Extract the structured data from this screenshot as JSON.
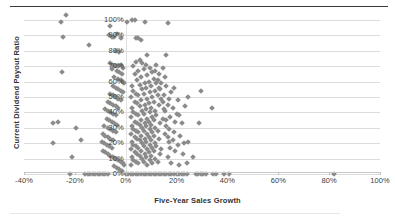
{
  "chart_data": {
    "type": "scatter",
    "title": "",
    "xlabel": "Five-Year Sales Growth",
    "ylabel": "Current Dividend Payout Ratio",
    "xlim": [
      -40,
      100
    ],
    "ylim": [
      0,
      100
    ],
    "xticks": [
      "-40%",
      "-20%",
      "0%",
      "20%",
      "40%",
      "60%",
      "80%",
      "100%"
    ],
    "xtick_values": [
      -40,
      -20,
      0,
      20,
      40,
      60,
      80,
      100
    ],
    "yticks": [
      "0%",
      "10%",
      "20%",
      "30%",
      "40%",
      "50%",
      "60%",
      "70%",
      "80%",
      "90%",
      "100%"
    ],
    "ytick_values": [
      0,
      10,
      20,
      30,
      40,
      50,
      60,
      70,
      80,
      90,
      100
    ],
    "grid": "horizontal",
    "legend": "none",
    "marker": "diamond",
    "marker_color": "#8b8b8b",
    "points": [
      [
        -23.5,
        103
      ],
      [
        -25.5,
        99
      ],
      [
        -24.5,
        89
      ],
      [
        -14.5,
        84
      ],
      [
        -25.0,
        66
      ],
      [
        -28.5,
        33
      ],
      [
        -26.5,
        34
      ],
      [
        -28.5,
        20
      ],
      [
        -19.5,
        30
      ],
      [
        -17.5,
        22
      ],
      [
        -21.0,
        11
      ],
      [
        -22.0,
        0
      ],
      [
        -16.0,
        0
      ],
      [
        -15.0,
        0
      ],
      [
        -14.0,
        0
      ],
      [
        -13.0,
        0
      ],
      [
        -12.0,
        0
      ],
      [
        -11.0,
        0
      ],
      [
        -10.0,
        0
      ],
      [
        -9.0,
        0
      ],
      [
        -8.0,
        0
      ],
      [
        -7.0,
        0
      ],
      [
        -6.0,
        96
      ],
      [
        -6.5,
        90
      ],
      [
        -5.5,
        89
      ],
      [
        -4.5,
        89
      ],
      [
        -3.5,
        91
      ],
      [
        -2.0,
        88
      ],
      [
        -4.0,
        80
      ],
      [
        -2.5,
        79
      ],
      [
        -6.0,
        72
      ],
      [
        -5.0,
        71
      ],
      [
        -4.0,
        70
      ],
      [
        -3.0,
        70
      ],
      [
        -2.0,
        71
      ],
      [
        -1.0,
        69
      ],
      [
        -5.5,
        68
      ],
      [
        -3.5,
        67
      ],
      [
        -2.5,
        66
      ],
      [
        -1.5,
        65
      ],
      [
        -4.5,
        63
      ],
      [
        -3.0,
        62
      ],
      [
        -2.0,
        61
      ],
      [
        -1.0,
        60
      ],
      [
        -0.5,
        59
      ],
      [
        -5.0,
        57
      ],
      [
        -4.0,
        56
      ],
      [
        -3.0,
        55
      ],
      [
        -2.0,
        54
      ],
      [
        -1.0,
        53
      ],
      [
        -6.0,
        52
      ],
      [
        -5.0,
        51
      ],
      [
        -4.0,
        50
      ],
      [
        -3.0,
        49
      ],
      [
        -2.0,
        48
      ],
      [
        -7.0,
        47
      ],
      [
        -6.0,
        46
      ],
      [
        -5.0,
        45
      ],
      [
        -4.0,
        44
      ],
      [
        -3.0,
        43
      ],
      [
        -8.0,
        42
      ],
      [
        -7.0,
        41
      ],
      [
        -6.0,
        40
      ],
      [
        -5.0,
        39
      ],
      [
        -4.0,
        38
      ],
      [
        -7.5,
        36
      ],
      [
        -6.5,
        35
      ],
      [
        -5.5,
        34
      ],
      [
        -4.5,
        33
      ],
      [
        -3.5,
        32
      ],
      [
        -8.5,
        31
      ],
      [
        -7.0,
        30
      ],
      [
        -6.0,
        29
      ],
      [
        -5.0,
        28
      ],
      [
        -4.0,
        27
      ],
      [
        -9.0,
        26
      ],
      [
        -8.0,
        25
      ],
      [
        -7.0,
        24
      ],
      [
        -6.0,
        23
      ],
      [
        -5.0,
        22
      ],
      [
        -9.5,
        21
      ],
      [
        -8.5,
        20
      ],
      [
        -7.5,
        19
      ],
      [
        -6.5,
        18
      ],
      [
        -5.5,
        17
      ],
      [
        -9.0,
        15
      ],
      [
        -8.0,
        14
      ],
      [
        -7.0,
        13
      ],
      [
        -6.0,
        12
      ],
      [
        -5.0,
        11
      ],
      [
        -4.0,
        10
      ],
      [
        -3.0,
        9
      ],
      [
        -2.0,
        8
      ],
      [
        -1.0,
        7
      ],
      [
        -0.5,
        6
      ],
      [
        -4.5,
        5
      ],
      [
        -3.5,
        4
      ],
      [
        -2.5,
        3
      ],
      [
        -1.5,
        2
      ],
      [
        0.5,
        99
      ],
      [
        2.5,
        100
      ],
      [
        3.5,
        100
      ],
      [
        7.5,
        99
      ],
      [
        4.0,
        88
      ],
      [
        5.0,
        88
      ],
      [
        6.0,
        87
      ],
      [
        8.5,
        77
      ],
      [
        5.5,
        74
      ],
      [
        4.0,
        73
      ],
      [
        6.5,
        72
      ],
      [
        8.0,
        71
      ],
      [
        3.0,
        70
      ],
      [
        9.5,
        69
      ],
      [
        7.0,
        68
      ],
      [
        5.0,
        67
      ],
      [
        10.5,
        66
      ],
      [
        3.5,
        65
      ],
      [
        8.5,
        64
      ],
      [
        6.0,
        63
      ],
      [
        11.0,
        62
      ],
      [
        4.5,
        61
      ],
      [
        9.0,
        60
      ],
      [
        7.5,
        59
      ],
      [
        12.0,
        59
      ],
      [
        5.5,
        58
      ],
      [
        10.0,
        57
      ],
      [
        2.5,
        57
      ],
      [
        8.0,
        56
      ],
      [
        13.0,
        56
      ],
      [
        6.5,
        55
      ],
      [
        11.5,
        54
      ],
      [
        3.0,
        54
      ],
      [
        9.5,
        53
      ],
      [
        4.0,
        52
      ],
      [
        7.0,
        52
      ],
      [
        12.5,
        51
      ],
      [
        5.0,
        51
      ],
      [
        10.5,
        50
      ],
      [
        2.0,
        50
      ],
      [
        8.5,
        49
      ],
      [
        14.0,
        49
      ],
      [
        6.0,
        48
      ],
      [
        11.0,
        47
      ],
      [
        3.5,
        47
      ],
      [
        9.0,
        46
      ],
      [
        4.5,
        46
      ],
      [
        7.5,
        45
      ],
      [
        13.0,
        45
      ],
      [
        5.5,
        44
      ],
      [
        10.0,
        43
      ],
      [
        2.5,
        43
      ],
      [
        8.0,
        42
      ],
      [
        15.0,
        42
      ],
      [
        6.5,
        41
      ],
      [
        11.5,
        41
      ],
      [
        3.0,
        40
      ],
      [
        9.5,
        40
      ],
      [
        4.0,
        39
      ],
      [
        7.0,
        39
      ],
      [
        12.0,
        38
      ],
      [
        5.0,
        38
      ],
      [
        10.5,
        37
      ],
      [
        2.0,
        37
      ],
      [
        8.5,
        36
      ],
      [
        14.5,
        36
      ],
      [
        6.0,
        35
      ],
      [
        11.0,
        35
      ],
      [
        3.5,
        34
      ],
      [
        9.0,
        34
      ],
      [
        4.5,
        33
      ],
      [
        7.5,
        33
      ],
      [
        13.5,
        33
      ],
      [
        5.5,
        32
      ],
      [
        10.0,
        32
      ],
      [
        2.5,
        31
      ],
      [
        8.0,
        31
      ],
      [
        16.0,
        31
      ],
      [
        6.5,
        30
      ],
      [
        11.5,
        30
      ],
      [
        3.0,
        29
      ],
      [
        9.5,
        29
      ],
      [
        4.0,
        28
      ],
      [
        7.0,
        28
      ],
      [
        12.5,
        28
      ],
      [
        5.0,
        27
      ],
      [
        10.5,
        27
      ],
      [
        2.0,
        26
      ],
      [
        8.5,
        26
      ],
      [
        15.5,
        26
      ],
      [
        6.0,
        25
      ],
      [
        11.0,
        25
      ],
      [
        3.5,
        24
      ],
      [
        9.0,
        24
      ],
      [
        4.5,
        23
      ],
      [
        7.5,
        23
      ],
      [
        13.0,
        23
      ],
      [
        5.5,
        22
      ],
      [
        10.0,
        22
      ],
      [
        2.5,
        21
      ],
      [
        8.0,
        21
      ],
      [
        17.0,
        21
      ],
      [
        6.5,
        20
      ],
      [
        11.5,
        20
      ],
      [
        3.0,
        19
      ],
      [
        9.5,
        19
      ],
      [
        4.0,
        18
      ],
      [
        7.0,
        18
      ],
      [
        12.0,
        18
      ],
      [
        5.0,
        17
      ],
      [
        10.5,
        17
      ],
      [
        2.0,
        16
      ],
      [
        8.5,
        16
      ],
      [
        14.0,
        16
      ],
      [
        6.0,
        15
      ],
      [
        11.0,
        15
      ],
      [
        3.5,
        14
      ],
      [
        9.0,
        14
      ],
      [
        4.5,
        13
      ],
      [
        7.5,
        13
      ],
      [
        13.5,
        13
      ],
      [
        5.5,
        12
      ],
      [
        10.0,
        12
      ],
      [
        2.5,
        11
      ],
      [
        8.0,
        11
      ],
      [
        16.5,
        11
      ],
      [
        6.5,
        10
      ],
      [
        11.5,
        10
      ],
      [
        3.0,
        9
      ],
      [
        9.5,
        9
      ],
      [
        4.0,
        8
      ],
      [
        7.0,
        8
      ],
      [
        12.5,
        8
      ],
      [
        5.0,
        7
      ],
      [
        10.5,
        7
      ],
      [
        2.0,
        6
      ],
      [
        8.5,
        6
      ],
      [
        18.0,
        7
      ],
      [
        21.0,
        6
      ],
      [
        24.0,
        7
      ],
      [
        26.5,
        11
      ],
      [
        22.5,
        13
      ],
      [
        19.5,
        15
      ],
      [
        17.5,
        17
      ],
      [
        20.5,
        19
      ],
      [
        23.0,
        20
      ],
      [
        18.5,
        22
      ],
      [
        16.5,
        24
      ],
      [
        21.5,
        25
      ],
      [
        19.0,
        27
      ],
      [
        17.0,
        29
      ],
      [
        24.5,
        21
      ],
      [
        16.0,
        35
      ],
      [
        19.5,
        34
      ],
      [
        22.0,
        33
      ],
      [
        17.5,
        37
      ],
      [
        20.0,
        39
      ],
      [
        15.5,
        41
      ],
      [
        18.5,
        43
      ],
      [
        21.0,
        38
      ],
      [
        16.5,
        45
      ],
      [
        23.5,
        44
      ],
      [
        14.5,
        47
      ],
      [
        17.0,
        49
      ],
      [
        20.5,
        48
      ],
      [
        15.0,
        51
      ],
      [
        18.0,
        53
      ],
      [
        13.5,
        55
      ],
      [
        16.0,
        57
      ],
      [
        19.0,
        56
      ],
      [
        14.0,
        59
      ],
      [
        12.5,
        61
      ],
      [
        15.5,
        63
      ],
      [
        13.0,
        65
      ],
      [
        11.5,
        67
      ],
      [
        14.5,
        69
      ],
      [
        12.0,
        71
      ],
      [
        16.0,
        77
      ],
      [
        16.5,
        98
      ],
      [
        29.5,
        54
      ],
      [
        34.0,
        43
      ],
      [
        29.0,
        33
      ],
      [
        24.5,
        50
      ],
      [
        0.0,
        0
      ],
      [
        1.0,
        0
      ],
      [
        2.0,
        0
      ],
      [
        3.0,
        0
      ],
      [
        4.0,
        0
      ],
      [
        5.0,
        0
      ],
      [
        6.0,
        0
      ],
      [
        7.0,
        0
      ],
      [
        8.0,
        0
      ],
      [
        9.0,
        0
      ],
      [
        10.0,
        0
      ],
      [
        11.0,
        0
      ],
      [
        12.0,
        0
      ],
      [
        13.0,
        0
      ],
      [
        14.0,
        0
      ],
      [
        15.0,
        0
      ],
      [
        16.0,
        0
      ],
      [
        17.0,
        0
      ],
      [
        18.0,
        0
      ],
      [
        19.0,
        0
      ],
      [
        20.0,
        0
      ],
      [
        21.0,
        0
      ],
      [
        22.0,
        0
      ],
      [
        23.0,
        0
      ],
      [
        24.0,
        0
      ],
      [
        27.5,
        0
      ],
      [
        28.5,
        0
      ],
      [
        29.5,
        0
      ],
      [
        30.5,
        0
      ],
      [
        31.5,
        0
      ],
      [
        34.5,
        0
      ],
      [
        35.5,
        0
      ],
      [
        38.5,
        0
      ],
      [
        40.5,
        0
      ],
      [
        82.0,
        0
      ]
    ]
  }
}
